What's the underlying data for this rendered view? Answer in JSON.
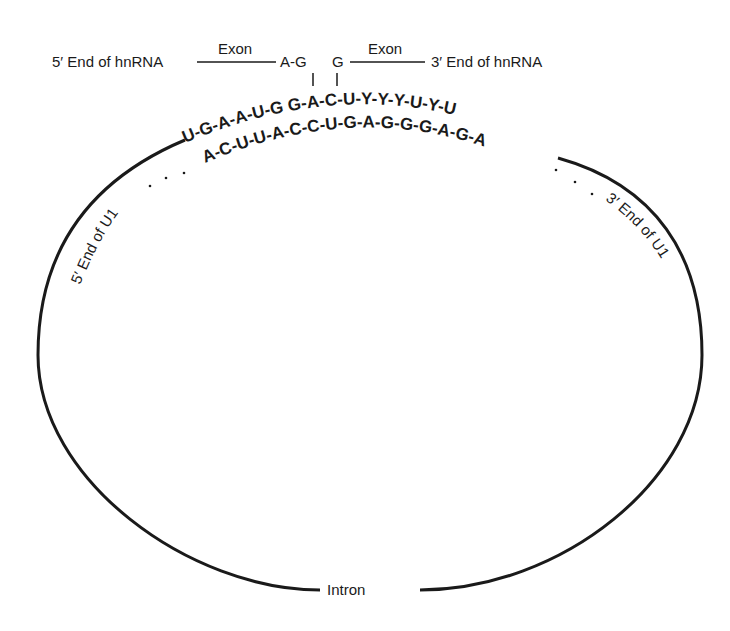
{
  "diagram": {
    "type": "U1 snRNP base-pairing with 5' splice site",
    "hnrna": {
      "left_label": "5′ End of hnRNA",
      "left_exon_label": "Exon",
      "left_junction": "A-G",
      "right_junction": "G",
      "right_exon_label": "Exon",
      "right_label": "3′ End of hnRNA"
    },
    "sequences": {
      "upper_strand": "U-G-A-A-U-G G-A-C-U-Y-Y-Y-U-Y-U",
      "upper_strand_left": "U-G-A-A-U-G",
      "upper_strand_right": "G-A-C-U-Y-Y-Y-U-Y-U",
      "lower_strand": "A-C-U-U-A-C-C-U-G-A-G-G-G-A-G-A"
    },
    "u1_labels": {
      "left": "5′ End of U1",
      "right": "3′ End of U1"
    },
    "loop_label": "Intron",
    "colors": {
      "ink": "#1a1a1a",
      "background": "#ffffff"
    }
  }
}
